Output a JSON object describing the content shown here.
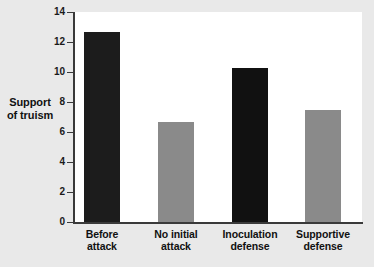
{
  "chart_data": {
    "type": "bar",
    "title": "",
    "xlabel": "",
    "ylabel": "Support of truism",
    "ylabel_line1": "Support",
    "ylabel_line2": "of truism",
    "categories": [
      "Before attack",
      "No initial attack",
      "Inoculation defense",
      "Supportive defense"
    ],
    "category_lines": [
      {
        "line1": "Before",
        "line2": "attack"
      },
      {
        "line1": "No initial",
        "line2": "attack"
      },
      {
        "line1": "Inoculation",
        "line2": "defense"
      },
      {
        "line1": "Supportive",
        "line2": "defense"
      }
    ],
    "values": [
      12.7,
      6.7,
      10.3,
      7.5
    ],
    "bar_colors": [
      "#1c1c1c",
      "#8a8a8a",
      "#111111",
      "#8a8a8a"
    ],
    "ylim": [
      0,
      14
    ],
    "yticks": [
      14,
      12,
      10,
      8,
      6,
      4,
      2,
      0
    ],
    "ytick_labels": [
      "14",
      "12",
      "10",
      "8",
      "6",
      "4",
      "2",
      "0"
    ],
    "grid": false,
    "legend": false,
    "legend_position": "none",
    "plot_background": "#ffffff",
    "page_background": "#e9e9e9",
    "axis_color": "#3a3a3a"
  }
}
